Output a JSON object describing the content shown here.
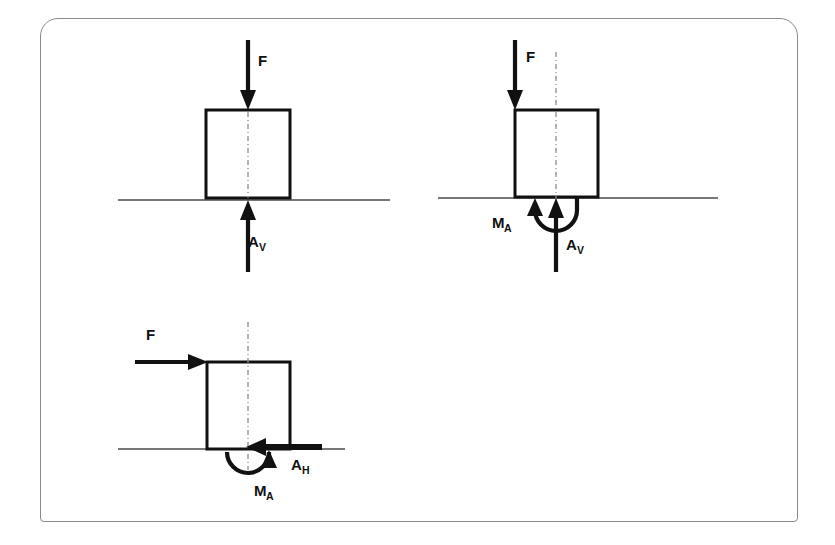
{
  "figure": {
    "frame": {
      "border_color": "#8a8a8a",
      "background_color": "#ffffff"
    },
    "ink_color": "#111111",
    "ground_color": "#4a4a4a",
    "axis_color": "#8d8d8d"
  },
  "diagrams": [
    {
      "id": "diagram-1",
      "name": "vertical-load-vertical-reaction",
      "position": "top-left",
      "labels": {
        "applied_force": "F",
        "reaction_vertical": "A",
        "reaction_vertical_sub": "V"
      },
      "elements": [
        "downward force arrow F on top face at centroid axis",
        "square body outline",
        "ground support line",
        "vertical centroid dash-dot axis",
        "upward reaction arrow A_V at centroid axis"
      ]
    },
    {
      "id": "diagram-2",
      "name": "eccentric-vertical-load-moment-reaction",
      "position": "top-right",
      "labels": {
        "applied_force": "F",
        "reaction_vertical": "A",
        "reaction_vertical_sub": "V",
        "reaction_moment": "M",
        "reaction_moment_sub": "A"
      },
      "elements": [
        "downward force arrow F at left edge of body",
        "square body outline",
        "ground support line",
        "vertical centroid dash-dot axis",
        "upward reaction arrow A_V at centroid axis",
        "counterclockwise moment arc M_A below support"
      ]
    },
    {
      "id": "diagram-3",
      "name": "horizontal-load-horizontal-and-moment-reaction",
      "position": "bottom-left",
      "labels": {
        "applied_force": "F",
        "reaction_horizontal": "A",
        "reaction_horizontal_sub": "H",
        "reaction_moment": "M",
        "reaction_moment_sub": "A"
      },
      "elements": [
        "rightward force arrow F at top-left corner of body",
        "square body outline",
        "ground support line",
        "vertical centroid dash-dot axis",
        "leftward reaction arrow A_H along support line",
        "clockwise moment arc M_A below support"
      ]
    }
  ]
}
